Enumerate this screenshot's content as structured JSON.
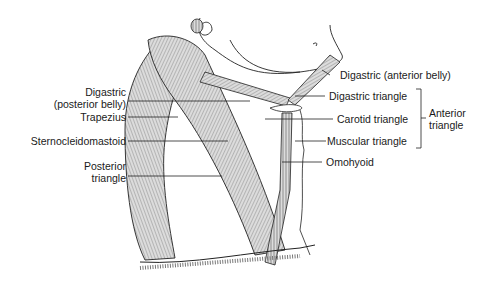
{
  "figure": {
    "labels_left": [
      {
        "id": "digastric-posterior",
        "line1": "Digastric",
        "line2": "(posterior belly)"
      },
      {
        "id": "trapezius",
        "line1": "Trapezius"
      },
      {
        "id": "sternocleidomastoid",
        "line1": "Sternocleidomastoid"
      },
      {
        "id": "posterior-triangle",
        "line1": "Posterior",
        "line2": "triangle"
      }
    ],
    "labels_right": [
      {
        "id": "digastric-anterior",
        "line1": "Digastric (anterior belly)"
      },
      {
        "id": "digastric-triangle",
        "line1": "Digastric triangle"
      },
      {
        "id": "carotid-triangle",
        "line1": "Carotid triangle"
      },
      {
        "id": "muscular-triangle",
        "line1": "Muscular triangle"
      },
      {
        "id": "omohyoid",
        "line1": "Omohyoid"
      }
    ],
    "bracket_group": {
      "line1": "Anterior",
      "line2": "triangle"
    }
  },
  "colors": {
    "ink": "#1a1a1a",
    "muscle_fill": "#d9d9d9",
    "background": "#ffffff"
  }
}
